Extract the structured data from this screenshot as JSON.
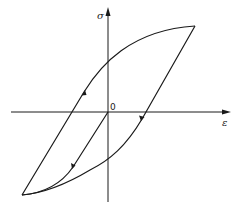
{
  "diagram": {
    "type": "stress-strain hysteresis loop",
    "axes": {
      "y_label": "σ",
      "x_label": "ε",
      "origin_label": "0"
    },
    "colors": {
      "line": "#1a1a1a",
      "background": "#ffffff"
    },
    "curves": [
      {
        "name": "initial-loading",
        "description": "from origin straight down-left, then curving into the lower-left tip"
      },
      {
        "name": "reloading-branch",
        "description": "from lower-left tip straight up-right through negative ε intercept, curving to upper-right tip"
      },
      {
        "name": "unloading-branch",
        "description": "from upper-right tip straight down-left through positive ε intercept, curving to lower-left tip"
      }
    ],
    "direction_markers": 3
  }
}
